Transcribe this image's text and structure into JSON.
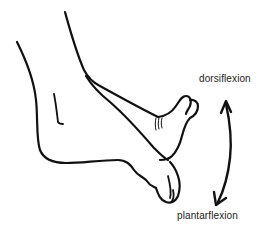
{
  "figure": {
    "labels": {
      "dorsiflexion": "dorsiflexion",
      "plantarflexion": "plantarflexion"
    },
    "arrow": {
      "type": "double-headed curved arrow",
      "direction_top": "dorsiflexion",
      "direction_bottom": "plantarflexion"
    },
    "colors": {
      "line": "#111111",
      "text": "#222222",
      "background": "#ffffff"
    }
  }
}
